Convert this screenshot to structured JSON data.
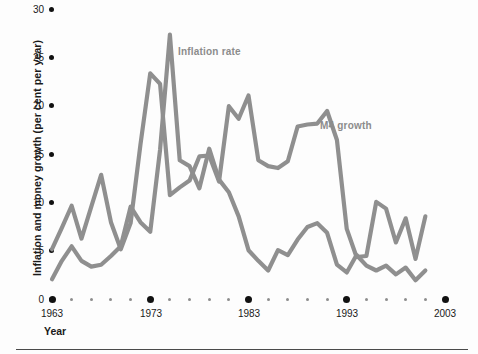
{
  "chart_data": {
    "type": "line",
    "title": "",
    "xlabel": "Year",
    "ylabel": "Inflation and money growth (per cent per year)",
    "xlim": [
      1963,
      2003
    ],
    "ylim": [
      0,
      30
    ],
    "yticks": [
      0,
      5,
      10,
      15,
      20,
      25,
      30
    ],
    "xticks": [
      1963,
      1973,
      1983,
      1993,
      2003
    ],
    "xtick_minor_step": 2,
    "grid": false,
    "legend_position": "inline-annotation",
    "line_color": "#8f8f8f",
    "axis_color": "#111111",
    "annotation_color": "#8c8c8c",
    "x": [
      1963,
      1964,
      1965,
      1966,
      1967,
      1968,
      1969,
      1970,
      1971,
      1972,
      1973,
      1974,
      1975,
      1976,
      1977,
      1978,
      1979,
      1980,
      1981,
      1982,
      1983,
      1984,
      1985,
      1986,
      1987,
      1988,
      1989,
      1990,
      1991,
      1992,
      1993,
      1994,
      1995,
      1996,
      1997,
      1998,
      1999,
      2000,
      2001
    ],
    "series": [
      {
        "name": "M4 growth",
        "values": [
          5.2,
          7.4,
          9.7,
          6.3,
          9.6,
          12.9,
          8.0,
          5.2,
          7.9,
          16.0,
          23.4,
          22.3,
          10.8,
          11.6,
          12.3,
          14.8,
          14.9,
          12.2,
          20.0,
          18.7,
          21.1,
          14.4,
          13.8,
          13.6,
          14.3,
          17.9,
          18.1,
          18.2,
          19.5,
          16.5,
          7.3,
          4.4,
          4.5,
          10.1,
          9.4,
          5.9,
          8.4,
          4.2,
          8.6
        ],
        "label_text": "M4 growth",
        "label_x": 1992,
        "label_y": 17.5
      },
      {
        "name": "Inflation rate",
        "values": [
          2.1,
          4.0,
          5.5,
          4.0,
          3.4,
          3.6,
          4.5,
          5.5,
          9.6,
          8.0,
          7.0,
          15.5,
          27.4,
          14.4,
          13.8,
          11.5,
          15.6,
          12.4,
          11.1,
          8.6,
          5.1,
          4.0,
          3.0,
          5.1,
          4.6,
          6.2,
          7.5,
          7.9,
          6.9,
          3.6,
          2.8,
          4.6,
          3.5,
          3.0,
          3.5,
          2.6,
          3.3,
          2.0,
          3.0
        ],
        "label_text": "Inflation rate",
        "label_x": 1976,
        "label_y": 25.0
      }
    ]
  },
  "axis": {
    "y_title": "Inflation and money growth (per cent per year)",
    "x_title": "Year",
    "y_tick_labels": [
      "30",
      "25",
      "20",
      "15",
      "10",
      "5",
      "0"
    ],
    "x_tick_labels": [
      "1963",
      "1973",
      "1983",
      "1993",
      "2003"
    ]
  },
  "annotations": {
    "inflation": "Inflation rate",
    "m4": "M4 growth"
  }
}
